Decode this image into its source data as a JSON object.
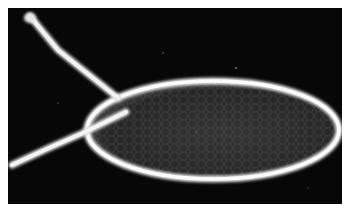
{
  "image": {
    "description": "Grayscale micrograph of an oval egg with two thread-like stalks on a black background",
    "background_color": "#070707",
    "outline_color": "#f0f0f0",
    "interior_color": "#2a2a2a"
  }
}
